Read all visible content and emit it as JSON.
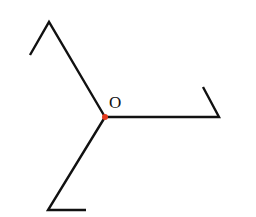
{
  "diagram": {
    "center_label": "O",
    "colors": {
      "line": "#111111",
      "center_point": "#e53a1e",
      "background": "#ffffff"
    },
    "center": [
      105,
      117
    ],
    "rays": [
      {
        "name": "upper-left",
        "points": [
          [
            105,
            117
          ],
          [
            49,
            22
          ],
          [
            30,
            55
          ]
        ]
      },
      {
        "name": "right",
        "points": [
          [
            105,
            117
          ],
          [
            219,
            117
          ],
          [
            203,
            87
          ]
        ]
      },
      {
        "name": "lower-left",
        "points": [
          [
            105,
            117
          ],
          [
            48,
            210
          ],
          [
            86,
            210
          ]
        ]
      }
    ]
  }
}
